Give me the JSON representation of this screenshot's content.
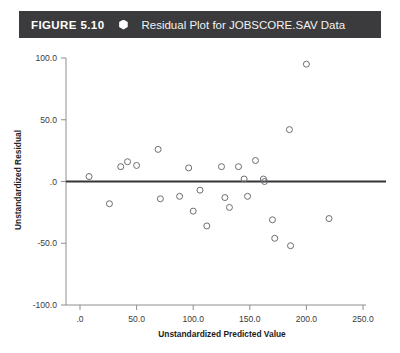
{
  "header": {
    "figure_number": "FIGURE 5.10",
    "bullet_icon": "hexagon-bullet-icon",
    "title": "Residual Plot for JOBSCORE.SAV Data",
    "bar_color": "#3b3b3d",
    "text_color": "#ffffff"
  },
  "chart_data": {
    "type": "scatter",
    "title": "Residual Plot for JOBSCORE.SAV Data",
    "xlabel": "Unstandardized Predicted Value",
    "ylabel": "Unstandardized Residual",
    "xlim": [
      0,
      250
    ],
    "ylim": [
      -100.0,
      100.0
    ],
    "xticks": [
      0,
      50,
      100,
      150,
      200,
      250
    ],
    "yticks": [
      -100.0,
      -50.0,
      0.0,
      50.0,
      100.0
    ],
    "xtick_labels": [
      ".0",
      "50.0",
      "100.0",
      "150.0",
      "200.0",
      "250.0"
    ],
    "ytick_labels": [
      "-100.0",
      "-50.0",
      ".0",
      "50.0",
      "100.0"
    ],
    "grid": false,
    "legend": false,
    "reference_line": {
      "y": 0.0,
      "color": "#343436"
    },
    "marker": {
      "shape": "open-circle",
      "color": "#6d6d72",
      "size": 3
    },
    "points": [
      {
        "x": 8,
        "y": 4
      },
      {
        "x": 26,
        "y": -18
      },
      {
        "x": 36,
        "y": 12
      },
      {
        "x": 42,
        "y": 16
      },
      {
        "x": 50,
        "y": 13
      },
      {
        "x": 69,
        "y": 26
      },
      {
        "x": 71,
        "y": -14
      },
      {
        "x": 88,
        "y": -12
      },
      {
        "x": 96,
        "y": 11
      },
      {
        "x": 100,
        "y": -24
      },
      {
        "x": 106,
        "y": -7
      },
      {
        "x": 112,
        "y": -36
      },
      {
        "x": 125,
        "y": 12
      },
      {
        "x": 128,
        "y": -13
      },
      {
        "x": 132,
        "y": -21
      },
      {
        "x": 140,
        "y": 12
      },
      {
        "x": 145,
        "y": 2
      },
      {
        "x": 148,
        "y": -12
      },
      {
        "x": 155,
        "y": 17
      },
      {
        "x": 162,
        "y": 2
      },
      {
        "x": 163,
        "y": 0
      },
      {
        "x": 170,
        "y": -31
      },
      {
        "x": 172,
        "y": -46
      },
      {
        "x": 185,
        "y": 42
      },
      {
        "x": 186,
        "y": -52
      },
      {
        "x": 200,
        "y": 95
      },
      {
        "x": 220,
        "y": -30
      }
    ]
  }
}
